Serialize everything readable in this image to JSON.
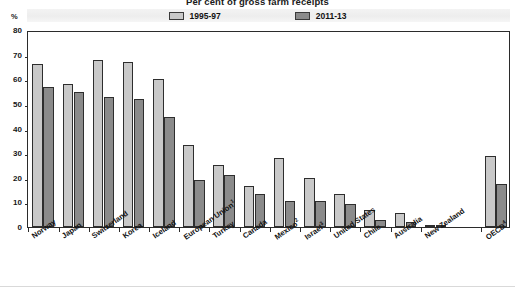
{
  "chart_data": {
    "type": "bar",
    "title": "Per cent of gross farm receipts",
    "xlabel": "",
    "ylabel": "%",
    "ylim": [
      0,
      80
    ],
    "yticks": [
      0,
      10,
      20,
      30,
      40,
      50,
      60,
      70,
      80
    ],
    "grid": false,
    "legend_position": "top-center",
    "categories": [
      "Norway",
      "Japan",
      "Switzerland",
      "Korea",
      "Iceland",
      "European Union",
      "Turkey",
      "Canada",
      "Mexico",
      "Israel",
      "United States",
      "Chile",
      "Australia",
      "New Zealand",
      "OECD"
    ],
    "category_footnotes": [
      "",
      "",
      "",
      "",
      "",
      "1",
      "",
      "",
      "2",
      "3",
      "",
      "",
      "",
      "",
      "4"
    ],
    "series": [
      {
        "name": "1995-97",
        "color": "#c9c9c9",
        "values": [
          66,
          58,
          68,
          67,
          60,
          33.5,
          25,
          16.5,
          28,
          20,
          13.5,
          7,
          5.5,
          1,
          29
        ]
      },
      {
        "name": "2011-13",
        "color": "#8b8b8b",
        "values": [
          57,
          55,
          53,
          52,
          44.5,
          19,
          21,
          13.5,
          10.5,
          10.5,
          9.5,
          3,
          2,
          0.8,
          17.5
        ]
      }
    ]
  },
  "legend": {
    "entries": [
      {
        "label": "1995-97",
        "color": "#c9c9c9"
      },
      {
        "label": "2011-13",
        "color": "#8b8b8b"
      }
    ]
  },
  "axes": {
    "y_unit": "%",
    "y_tick_labels": [
      "80",
      "70",
      "60",
      "50",
      "40",
      "30",
      "20",
      "10",
      "0"
    ]
  }
}
